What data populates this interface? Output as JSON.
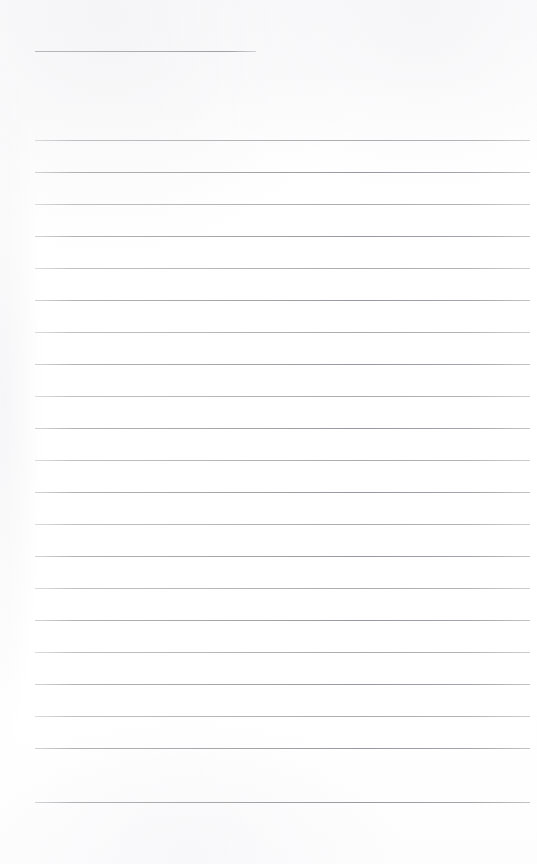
{
  "document": {
    "type": "scanned-ruled-notepaper",
    "state": "blank",
    "page_width": 537,
    "page_height": 864,
    "background_color": "#ffffff",
    "rule_color": "#b9bbbd",
    "content_text": "",
    "title_text": ""
  },
  "title_rule": {
    "name": "title-rule",
    "x": 35,
    "y": 51,
    "width": 221,
    "thickness": 1
  },
  "body_rules": {
    "left_x": 35,
    "right_x": 530,
    "width": 495,
    "first_y": 140,
    "spacing": 32,
    "count": 21,
    "lines": [
      {
        "index": 1,
        "y": 140,
        "weight": "soft"
      },
      {
        "index": 2,
        "y": 172,
        "weight": "dark"
      },
      {
        "index": 3,
        "y": 204,
        "weight": "soft"
      },
      {
        "index": 4,
        "y": 236,
        "weight": "dark"
      },
      {
        "index": 5,
        "y": 268,
        "weight": "soft"
      },
      {
        "index": 6,
        "y": 300,
        "weight": "dark"
      },
      {
        "index": 7,
        "y": 332,
        "weight": "soft"
      },
      {
        "index": 8,
        "y": 364,
        "weight": "dark"
      },
      {
        "index": 9,
        "y": 396,
        "weight": "soft"
      },
      {
        "index": 10,
        "y": 428,
        "weight": "dark"
      },
      {
        "index": 11,
        "y": 460,
        "weight": "soft"
      },
      {
        "index": 12,
        "y": 492,
        "weight": "dark"
      },
      {
        "index": 13,
        "y": 524,
        "weight": "soft"
      },
      {
        "index": 14,
        "y": 556,
        "weight": "dark"
      },
      {
        "index": 15,
        "y": 588,
        "weight": "soft"
      },
      {
        "index": 16,
        "y": 620,
        "weight": "dark"
      },
      {
        "index": 17,
        "y": 652,
        "weight": "soft"
      },
      {
        "index": 18,
        "y": 684,
        "weight": "dark"
      },
      {
        "index": 19,
        "y": 716,
        "weight": "soft"
      },
      {
        "index": 20,
        "y": 748,
        "weight": "dark"
      },
      {
        "index": 21,
        "y": 802,
        "weight": "dark"
      }
    ]
  }
}
